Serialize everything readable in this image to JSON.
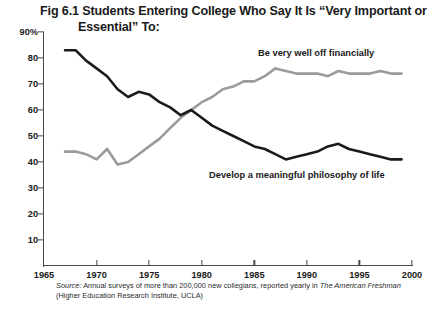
{
  "title": {
    "line1": "Fig 6.1 Students Entering College Who Say It Is “Very Important or",
    "line2": "Essential” To:"
  },
  "source": {
    "prefix": "Source:",
    "body": " Annual surveys of more than 200,000 new collegians, reported yearly in ",
    "italic_publication": "The American Freshman",
    "line2": "(Higher Education Research Institute, UCLA)"
  },
  "colors": {
    "series_philosophy": "#1a1a1a",
    "series_financial": "#9b9b9b",
    "axis": "#4a4a4a",
    "text": "#1a1a1a",
    "background": "#ffffff"
  },
  "chart_data": {
    "type": "line",
    "title": "Fig 6.1 Students Entering College Who Say It Is “Very Important or Essential” To:",
    "xlabel": "",
    "ylabel": "",
    "xlim": [
      1965,
      2000
    ],
    "ylim": [
      0,
      90
    ],
    "grid": false,
    "legend_position": "inline-annotations",
    "xticks": [
      1965,
      1970,
      1975,
      1980,
      1985,
      1990,
      1995,
      2000
    ],
    "xtick_labels": [
      "1965",
      "1970",
      "1975",
      "1980",
      "1985",
      "1990",
      "1995",
      "2000"
    ],
    "yticks": [
      0,
      10,
      20,
      30,
      40,
      50,
      60,
      70,
      80,
      90
    ],
    "ytick_labels": [
      "",
      "10",
      "20",
      "30",
      "40",
      "50",
      "60",
      "70",
      "80",
      "90%"
    ],
    "series": [
      {
        "name": "Develop a meaningful philosophy of life",
        "color": "#1a1a1a",
        "x": [
          1967,
          1968,
          1969,
          1970,
          1971,
          1972,
          1973,
          1974,
          1975,
          1976,
          1977,
          1978,
          1979,
          1980,
          1981,
          1982,
          1983,
          1984,
          1985,
          1986,
          1987,
          1988,
          1989,
          1990,
          1991,
          1992,
          1993,
          1994,
          1995,
          1996,
          1997,
          1998,
          1999
        ],
        "values": [
          83,
          83,
          79,
          76,
          73,
          68,
          65,
          67,
          66,
          63,
          61,
          58,
          60,
          57,
          54,
          52,
          50,
          48,
          46,
          45,
          43,
          41,
          42,
          43,
          44,
          46,
          47,
          45,
          44,
          43,
          42,
          41,
          41
        ]
      },
      {
        "name": "Be very well off financially",
        "color": "#9b9b9b",
        "x": [
          1967,
          1968,
          1969,
          1970,
          1971,
          1972,
          1973,
          1974,
          1975,
          1976,
          1977,
          1978,
          1979,
          1980,
          1981,
          1982,
          1983,
          1984,
          1985,
          1986,
          1987,
          1988,
          1989,
          1990,
          1991,
          1992,
          1993,
          1994,
          1995,
          1996,
          1997,
          1998,
          1999
        ],
        "values": [
          44,
          44,
          43,
          41,
          45,
          39,
          40,
          43,
          46,
          49,
          53,
          57,
          60,
          63,
          65,
          68,
          69,
          71,
          71,
          73,
          76,
          75,
          74,
          74,
          74,
          73,
          75,
          74,
          74,
          74,
          75,
          74,
          74
        ]
      }
    ],
    "annotations": [
      {
        "text": "Be very well off financially",
        "series": "Be very well off financially",
        "x": 1985,
        "y": 81
      },
      {
        "text": "Develop a meaningful philosophy of life",
        "series": "Develop a meaningful philosophy of life",
        "x": 1982,
        "y": 35
      }
    ]
  }
}
